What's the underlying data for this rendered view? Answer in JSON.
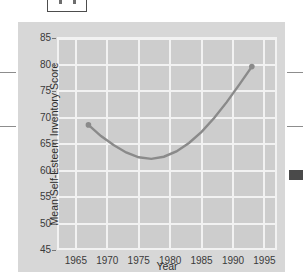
{
  "page": {
    "background_color": "#ffffff",
    "panel_color": "#d7d7d7",
    "plot_color": "#cdcdcd",
    "grid_color": "#f2f2f2",
    "curve_color": "#8a8a8a"
  },
  "corner_box": {
    "name": "figure-number-box",
    "tick_count": 2
  },
  "edge_marks": {
    "left": [
      72,
      126
    ],
    "right": [
      72,
      126
    ],
    "dark_tab": {
      "top": 170,
      "width": 14,
      "height": 10,
      "color": "#4a4a4a"
    }
  },
  "chart_data": {
    "type": "line",
    "title": "",
    "subtitle": "",
    "xlabel": "Year",
    "ylabel": "Mean Self-Esteem Inventory Score",
    "xlim": [
      1962,
      1997
    ],
    "ylim": [
      45,
      85
    ],
    "xticks": [
      1965,
      1970,
      1975,
      1980,
      1985,
      1990,
      1995
    ],
    "yticks": [
      45,
      50,
      55,
      60,
      65,
      70,
      75,
      80,
      85
    ],
    "xtick_labels": [
      "1965",
      "1970",
      "1975",
      "1980",
      "1985",
      "1990",
      "1995"
    ],
    "ytick_labels": [
      "45",
      "50",
      "55",
      "60",
      "65",
      "70",
      "75",
      "80",
      "85"
    ],
    "grid": true,
    "legend": false,
    "series": [
      {
        "name": "Mean Self-Esteem Inventory Score",
        "color": "#8a8a8a",
        "markers_at_endpoints": true,
        "x": [
          1967,
          1969,
          1971,
          1973,
          1975,
          1977,
          1979,
          1981,
          1983,
          1985,
          1987,
          1989,
          1991,
          1993
        ],
        "values": [
          68.6,
          66.5,
          64.8,
          63.4,
          62.5,
          62.2,
          62.6,
          63.6,
          65.2,
          67.3,
          69.9,
          72.9,
          76.2,
          79.6
        ]
      }
    ],
    "annotations": [
      {
        "label": "start point",
        "x": 1967,
        "y": 68.6
      },
      {
        "label": "minimum",
        "x": 1977,
        "y": 62.2
      },
      {
        "label": "end point",
        "x": 1993,
        "y": 79.6
      }
    ]
  }
}
